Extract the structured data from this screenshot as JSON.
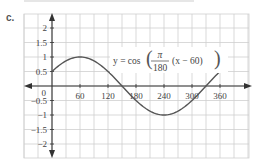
{
  "part_label": "c.",
  "chart_data": {
    "type": "line",
    "title": "",
    "equation": "y = cos(π/180 (x − 60))",
    "equation_parts": {
      "lhs": "y = cos",
      "num": "π",
      "den": "180",
      "rest": "(x − 60)"
    },
    "xlabel": "",
    "ylabel": "",
    "x_ticks": [
      "60",
      "120",
      "180",
      "240",
      "300",
      "360"
    ],
    "y_ticks": [
      "2",
      "1.5",
      "1",
      "0.5",
      "0",
      "−0.5",
      "−1",
      "−1.5",
      "−2"
    ],
    "origin_label": "0",
    "xlim": [
      -60,
      420
    ],
    "ylim": [
      -2.5,
      2.5
    ],
    "grid": true,
    "series": [
      {
        "name": "y = cos(π/180 (x − 60))",
        "x": [
          0,
          60,
          150,
          240,
          330,
          360
        ],
        "y": [
          0.5,
          1,
          0,
          -1,
          0,
          0.5
        ]
      }
    ],
    "colors": {
      "curve": "#555555",
      "grid": "#cfcfcf",
      "axis": "#333333"
    }
  }
}
